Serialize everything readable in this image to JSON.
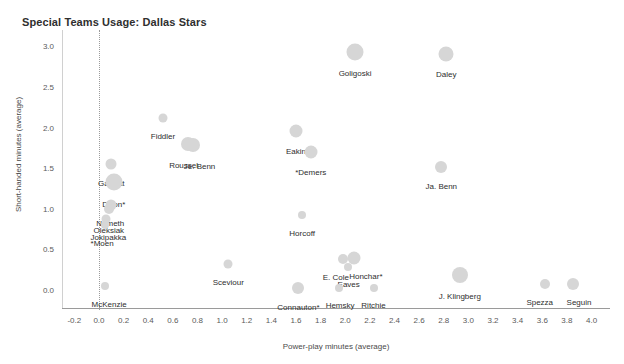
{
  "chart_data": {
    "type": "scatter",
    "title": "Special Teams Usage: Dallas Stars",
    "xlabel": "Power-play minutes (average)",
    "ylabel": "Short-handed minutes (average)",
    "xlim": [
      -0.3,
      4.15
    ],
    "ylim": [
      -0.22,
      3.2
    ],
    "grid": false,
    "legend": "none",
    "bubble_color": "#d6d6d6",
    "reference_line_x": 0.0,
    "xticks": [
      "-0.2",
      "0.0",
      "0.2",
      "0.4",
      "0.6",
      "0.8",
      "1.0",
      "1.2",
      "1.4",
      "1.6",
      "1.8",
      "2.0",
      "2.2",
      "2.4",
      "2.6",
      "2.8",
      "3.0",
      "3.2",
      "3.4",
      "3.6",
      "3.8",
      "4.0"
    ],
    "xtick_values": [
      -0.2,
      0.0,
      0.2,
      0.4,
      0.6,
      0.8,
      1.0,
      1.2,
      1.4,
      1.6,
      1.8,
      2.0,
      2.2,
      2.4,
      2.6,
      2.8,
      3.0,
      3.2,
      3.4,
      3.6,
      3.8,
      4.0
    ],
    "yticks": [
      "0.0",
      "0.5",
      "1.0",
      "1.5",
      "2.0",
      "2.5",
      "3.0"
    ],
    "ytick_values": [
      0.0,
      0.5,
      1.0,
      1.5,
      2.0,
      2.5,
      3.0
    ],
    "points": [
      {
        "label": "Goligoski",
        "x": 2.08,
        "y": 2.93,
        "size": 17,
        "label_dx": 0,
        "label_dy": 17
      },
      {
        "label": "Daley",
        "x": 2.82,
        "y": 2.9,
        "size": 15,
        "label_dx": 0,
        "label_dy": 16
      },
      {
        "label": "Fiddler",
        "x": 0.52,
        "y": 2.12,
        "size": 9,
        "label_dx": 0,
        "label_dy": 14
      },
      {
        "label": "Eakin",
        "x": 1.6,
        "y": 1.96,
        "size": 13,
        "label_dx": 0,
        "label_dy": 16
      },
      {
        "label": "Roussel",
        "x": 0.72,
        "y": 1.8,
        "size": 14,
        "label_dx": -4,
        "label_dy": 17
      },
      {
        "label": "Je. Benn",
        "x": 0.76,
        "y": 1.78,
        "size": 14,
        "label_dx": 7,
        "label_dy": 17
      },
      {
        "label": "*Demers",
        "x": 1.72,
        "y": 1.7,
        "size": 13,
        "label_dx": 0,
        "label_dy": 16
      },
      {
        "label": "Ja. Benn",
        "x": 2.78,
        "y": 1.52,
        "size": 12,
        "label_dx": 0,
        "label_dy": 15
      },
      {
        "label": "Garbutt",
        "x": 0.1,
        "y": 1.55,
        "size": 11,
        "label_dx": 0,
        "label_dy": 15
      },
      {
        "label": "Dillon*",
        "x": 0.12,
        "y": 1.33,
        "size": 17,
        "label_dx": 0,
        "label_dy": 18
      },
      {
        "label": "Nemeth",
        "x": 0.1,
        "y": 1.05,
        "size": 11,
        "label_dx": -1,
        "label_dy": 14
      },
      {
        "label": "Oleksiak",
        "x": 0.08,
        "y": 1.0,
        "size": 10,
        "label_dx": 0,
        "label_dy": 17
      },
      {
        "label": "Jokipakka",
        "x": 0.06,
        "y": 0.88,
        "size": 9,
        "label_dx": 2,
        "label_dy": 14
      },
      {
        "label": "*Moen",
        "x": 0.05,
        "y": 0.8,
        "size": 8,
        "label_dx": -3,
        "label_dy": 14
      },
      {
        "label": "Horcoff",
        "x": 1.65,
        "y": 0.93,
        "size": 8,
        "label_dx": 0,
        "label_dy": 14
      },
      {
        "label": "Sceviour",
        "x": 1.05,
        "y": 0.32,
        "size": 9,
        "label_dx": 0,
        "label_dy": 14
      },
      {
        "label": "E. Cole",
        "x": 1.98,
        "y": 0.38,
        "size": 10,
        "label_dx": -7,
        "label_dy": 14
      },
      {
        "label": "Honchar*",
        "x": 2.07,
        "y": 0.4,
        "size": 13,
        "label_dx": 12,
        "label_dy": 14
      },
      {
        "label": "Eaves",
        "x": 2.02,
        "y": 0.28,
        "size": 8,
        "label_dx": 1,
        "label_dy": 13
      },
      {
        "label": "J. Klingberg",
        "x": 2.93,
        "y": 0.18,
        "size": 16,
        "label_dx": 0,
        "label_dy": 17
      },
      {
        "label": "McKenzie",
        "x": 0.05,
        "y": 0.05,
        "size": 8,
        "label_dx": 4,
        "label_dy": 14
      },
      {
        "label": "Connauton*",
        "x": 1.62,
        "y": 0.02,
        "size": 12,
        "label_dx": 0,
        "label_dy": 15
      },
      {
        "label": "Hemsky",
        "x": 1.95,
        "y": 0.02,
        "size": 8,
        "label_dx": 1,
        "label_dy": 13
      },
      {
        "label": "Ritchie",
        "x": 2.23,
        "y": 0.02,
        "size": 8,
        "label_dx": 0,
        "label_dy": 13
      },
      {
        "label": "Spezza",
        "x": 3.62,
        "y": 0.08,
        "size": 10,
        "label_dx": -5,
        "label_dy": 14
      },
      {
        "label": "Seguin",
        "x": 3.85,
        "y": 0.08,
        "size": 12,
        "label_dx": 6,
        "label_dy": 14
      }
    ]
  }
}
